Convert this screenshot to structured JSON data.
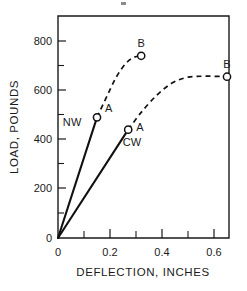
{
  "chart_data": {
    "type": "line",
    "title": "",
    "xlabel": "DEFLECTION, INCHES",
    "ylabel": "LOAD, POUNDS",
    "xlim": [
      0,
      0.66
    ],
    "ylim": [
      0,
      880
    ],
    "grid": false,
    "legend": "inline-annotations",
    "x_ticks": [
      {
        "value": 0,
        "label": "0",
        "major": true
      },
      {
        "value": 0.1,
        "label": "",
        "major": false
      },
      {
        "value": 0.2,
        "label": "0.2",
        "major": true
      },
      {
        "value": 0.3,
        "label": "",
        "major": false
      },
      {
        "value": 0.4,
        "label": "0.4",
        "major": true
      },
      {
        "value": 0.5,
        "label": "",
        "major": false
      },
      {
        "value": 0.6,
        "label": "0.6",
        "major": true
      }
    ],
    "y_ticks": [
      {
        "value": 0,
        "label": "0",
        "major": true
      },
      {
        "value": 100,
        "label": "",
        "major": false
      },
      {
        "value": 200,
        "label": "200",
        "major": true
      },
      {
        "value": 300,
        "label": "",
        "major": false
      },
      {
        "value": 400,
        "label": "400",
        "major": true
      },
      {
        "value": 500,
        "label": "",
        "major": false
      },
      {
        "value": 600,
        "label": "600",
        "major": true
      },
      {
        "value": 700,
        "label": "",
        "major": false
      },
      {
        "value": 800,
        "label": "800",
        "major": true
      }
    ],
    "series": [
      {
        "name": "NW",
        "label": "NW",
        "label_x": 0.055,
        "label_y": 455,
        "solid_points": [
          [
            0,
            0
          ],
          [
            0.15,
            490
          ]
        ],
        "dashed_points": [
          [
            0.15,
            490
          ],
          [
            0.19,
            580
          ],
          [
            0.225,
            655
          ],
          [
            0.26,
            708
          ],
          [
            0.29,
            733
          ],
          [
            0.32,
            740
          ]
        ],
        "markers": [
          {
            "label": "A",
            "x": 0.15,
            "y": 490
          },
          {
            "label": "B",
            "x": 0.32,
            "y": 740
          }
        ]
      },
      {
        "name": "CW",
        "label": "CW",
        "label_x": 0.285,
        "label_y": 375,
        "solid_points": [
          [
            0,
            0
          ],
          [
            0.27,
            440
          ]
        ],
        "dashed_points": [
          [
            0.27,
            440
          ],
          [
            0.32,
            510
          ],
          [
            0.38,
            580
          ],
          [
            0.44,
            630
          ],
          [
            0.5,
            653
          ],
          [
            0.57,
            657
          ],
          [
            0.65,
            655
          ]
        ],
        "markers": [
          {
            "label": "A",
            "x": 0.27,
            "y": 440
          },
          {
            "label": "B",
            "x": 0.65,
            "y": 655
          }
        ]
      }
    ]
  },
  "axes": {
    "x_title": "DEFLECTION, INCHES",
    "y_title": "LOAD, POUNDS"
  },
  "tick_labels": {
    "x": [
      "0",
      "0.2",
      "0.4",
      "0.6"
    ],
    "y": [
      "0",
      "200",
      "400",
      "600",
      "800"
    ]
  },
  "annotations": {
    "nw_label": "NW",
    "cw_label": "CW",
    "nw_point_a": "A",
    "nw_point_b": "B",
    "cw_point_a": "A",
    "cw_point_b": "B"
  }
}
